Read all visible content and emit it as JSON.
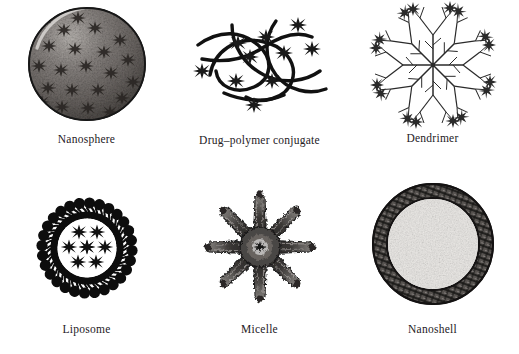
{
  "figure": {
    "background_color": "#ffffff",
    "ink_color": "#1a1a1a",
    "caption_color": "#24201e",
    "rows": 2,
    "columns": 3
  },
  "panels": [
    {
      "id": "nanosphere",
      "caption": "Nanosphere",
      "row": 1,
      "column": 1,
      "shape": "filled-speckled-circle",
      "description": "Solid gray speckled sphere with dark star-shaped drug molecules dispersed throughout the matrix",
      "fill_color": "#6e6a68",
      "highlight_color": "#cfcbc8",
      "outline_color": "#1a1a1a",
      "drug_marker": "star",
      "drug_marker_count": 22
    },
    {
      "id": "drug-polymer-conjugate",
      "caption": "Drug–polymer conjugate",
      "row": 1,
      "column": 2,
      "shape": "tangled-chains",
      "description": "Tangled thick black polymer chains with star-shaped drug molecules covalently attached along the strands",
      "stroke_color": "#111111",
      "drug_marker": "star",
      "drug_marker_count": 10,
      "chain_count": 5
    },
    {
      "id": "dendrimer",
      "caption": "Dendrimer",
      "row": 1,
      "column": 3,
      "shape": "radial-branching-tree",
      "description": "Thin line branching tree radiating from a central core, with star-shaped drug molecules at the branch tips",
      "stroke_color": "#2a2a2a",
      "drug_marker": "star",
      "drug_marker_count": 10,
      "primary_branches": 8
    },
    {
      "id": "liposome",
      "caption": "Liposome",
      "row": 2,
      "column": 1,
      "shape": "bilayer-vesicle",
      "description": "Vesicle with a thick black phospholipid bilayer ring, radiating lipid molecules with round heads and wavy tails, enclosing an aqueous core with star-shaped drug molecules",
      "membrane_color": "#0d0d0d",
      "core_color": "#ffffff",
      "lipid_count": 28,
      "drug_marker": "star",
      "drug_marker_count": 8
    },
    {
      "id": "micelle",
      "caption": "Micelle",
      "row": 2,
      "column": 2,
      "shape": "radiating-starburst",
      "description": "Star-burst aggregate with eight thick tapering amphiphile arms radiating from a dense textured core containing a drug molecule",
      "arm_count": 8,
      "ink_color": "#2b2b2b",
      "core_marker": "star"
    },
    {
      "id": "nanoshell",
      "caption": "Nanoshell",
      "row": 2,
      "column": 3,
      "shape": "core-shell-sphere",
      "description": "Spherical particle with a dark cross-hatched metallic outer shell surrounding a light speckled dielectric core",
      "shell_color": "#4a4745",
      "core_color": "#f0eeec",
      "outline_color": "#1a1a1a"
    }
  ]
}
